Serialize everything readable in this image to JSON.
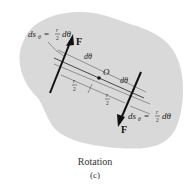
{
  "diagram": {
    "body_color": "#d9d9d9",
    "line_color": "#222222",
    "labels": {
      "ds_top": "ds",
      "ds_top_sub": "θ",
      "ds_top_eq": "= ",
      "ds_top_frac_num": "r",
      "ds_top_frac_den": "2",
      "ds_top_tail": "dθ",
      "force_top": "F",
      "dtheta_top": "dθ",
      "origin": "O",
      "dtheta_mid": "dθ",
      "r_half_left_num": "r",
      "r_half_left_den": "2",
      "r_half_right_num": "r",
      "r_half_right_den": "2",
      "ds_bottom": "ds",
      "ds_bottom_sub": "θ",
      "ds_bottom_eq": "= ",
      "ds_bottom_frac_num": "r",
      "ds_bottom_frac_den": "2",
      "ds_bottom_tail": "dθ",
      "force_bottom": "F"
    },
    "caption": {
      "title": "Rotation",
      "sub": "(c)"
    }
  }
}
